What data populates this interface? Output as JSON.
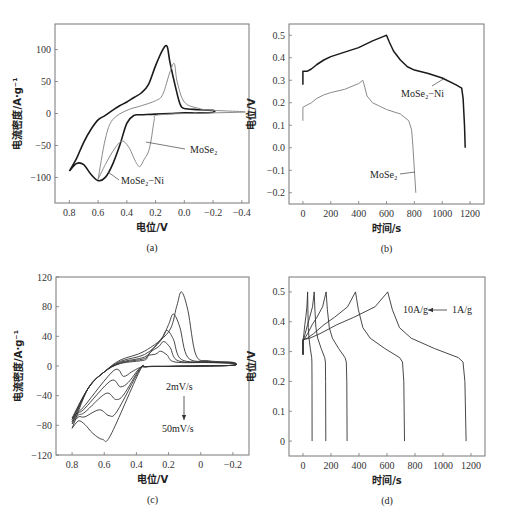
{
  "figure": {
    "panels": [
      "(a)",
      "(b)",
      "(c)",
      "(d)"
    ]
  },
  "chart_data": [
    {
      "id": "a",
      "type": "line",
      "panel_label": "(a)",
      "xlabel": "电位/V",
      "ylabel": "电流密度/A·g⁻¹",
      "xlim": [
        0.9,
        -0.45
      ],
      "ylim": [
        -140,
        140
      ],
      "xticks": [
        0.8,
        0.6,
        0.4,
        0.2,
        0.0,
        -0.2,
        -0.4
      ],
      "xtick_labels": [
        "0.8",
        "0.6",
        "0.4",
        "0.2",
        "0.0",
        "−0.2",
        "−0.4"
      ],
      "yticks": [
        100,
        50,
        0,
        -50,
        -100
      ],
      "ytick_labels": [
        "100",
        "50",
        "0",
        "−50",
        "−100"
      ],
      "frame": {
        "left": 55,
        "top": 24,
        "right": 249,
        "bottom": 203
      },
      "series": [
        {
          "name": "MoSe₂-Ni",
          "color": "#1a1a1a",
          "width": 1.6,
          "x": [
            0.8,
            0.75,
            0.7,
            0.65,
            0.6,
            0.55,
            0.5,
            0.45,
            0.4,
            0.35,
            0.3,
            0.2,
            0.1,
            0.0,
            -0.1,
            -0.2,
            -0.2,
            -0.1,
            0.0,
            0.03,
            0.06,
            0.1,
            0.12,
            0.15,
            0.2,
            0.25,
            0.3,
            0.35,
            0.4,
            0.45,
            0.5,
            0.55,
            0.6,
            0.65,
            0.7,
            0.75,
            0.8
          ],
          "y": [
            -90,
            -78,
            -80,
            -95,
            -105,
            -100,
            -80,
            -50,
            -15,
            -3,
            -2,
            -1,
            0,
            1,
            1,
            2,
            5,
            6,
            8,
            15,
            40,
            80,
            105,
            100,
            75,
            45,
            32,
            25,
            18,
            12,
            5,
            -3,
            -10,
            -25,
            -45,
            -70,
            -90
          ]
        },
        {
          "name": "MoSe₂",
          "color": "#8a8a8a",
          "width": 1.0,
          "x": [
            0.6,
            0.55,
            0.5,
            0.45,
            0.42,
            0.38,
            0.34,
            0.31,
            0.28,
            0.25,
            0.23,
            0.21,
            0.2,
            0.1,
            0.0,
            -0.2,
            -0.4,
            -0.4,
            -0.2,
            -0.1,
            0.0,
            0.05,
            0.07,
            0.1,
            0.15,
            0.2,
            0.3,
            0.4,
            0.5,
            0.55,
            0.6
          ],
          "y": [
            -103,
            -80,
            -60,
            -45,
            -44,
            -55,
            -75,
            -83,
            -72,
            -60,
            -40,
            -10,
            -3,
            -1,
            0,
            1,
            2,
            3,
            5,
            8,
            18,
            50,
            78,
            65,
            30,
            20,
            12,
            5,
            -10,
            -40,
            -103
          ]
        }
      ],
      "annotations": [
        {
          "text": "MoSe₂",
          "x": 190,
          "y": 153,
          "line": [
            [
              146,
              142
            ],
            [
              185,
              149
            ]
          ]
        },
        {
          "text": "MoSe₂−Ni",
          "x": 121,
          "y": 184,
          "line": [
            [
              108,
              172
            ],
            [
              119,
              180
            ]
          ]
        }
      ]
    },
    {
      "id": "b",
      "type": "line",
      "panel_label": "(b)",
      "xlabel": "时间/s",
      "ylabel": "电位/V",
      "xlim": [
        -100,
        1300
      ],
      "ylim": [
        -0.25,
        0.55
      ],
      "xticks": [
        0,
        200,
        400,
        600,
        800,
        1000,
        1200
      ],
      "xtick_labels": [
        "0",
        "200",
        "400",
        "600",
        "800",
        "1000",
        "1200"
      ],
      "yticks": [
        0.5,
        0.4,
        0.3,
        0.2,
        0.1,
        0.0,
        -0.1,
        -0.2
      ],
      "ytick_labels": [
        "0.5",
        "0.4",
        "0.3",
        "0.2",
        "0.1",
        "0.0",
        "−0.1",
        "−0.2"
      ],
      "frame": {
        "left": 289,
        "top": 24,
        "right": 484,
        "bottom": 204
      },
      "series": [
        {
          "name": "MoSe₂-Ni",
          "color": "#1a1a1a",
          "width": 1.5,
          "x": [
            0,
            0,
            30,
            60,
            100,
            150,
            200,
            300,
            400,
            500,
            580,
            600,
            620,
            650,
            700,
            750,
            800,
            900,
            1000,
            1100,
            1140,
            1150,
            1160,
            1165
          ],
          "y": [
            0.28,
            0.34,
            0.34,
            0.35,
            0.37,
            0.39,
            0.405,
            0.425,
            0.445,
            0.475,
            0.495,
            0.5,
            0.47,
            0.43,
            0.39,
            0.36,
            0.345,
            0.33,
            0.31,
            0.28,
            0.265,
            0.22,
            0.1,
            0.0
          ]
        },
        {
          "name": "MoSe₂",
          "color": "#8a8a8a",
          "width": 1.0,
          "x": [
            0,
            0,
            30,
            60,
            100,
            150,
            200,
            300,
            400,
            430,
            440,
            460,
            500,
            550,
            600,
            700,
            760,
            780,
            790,
            800,
            810
          ],
          "y": [
            0.12,
            0.18,
            0.19,
            0.2,
            0.22,
            0.235,
            0.245,
            0.26,
            0.285,
            0.3,
            0.28,
            0.23,
            0.2,
            0.185,
            0.17,
            0.15,
            0.12,
            0.08,
            0.0,
            -0.1,
            -0.2
          ]
        }
      ],
      "annotations": [
        {
          "text": "MoSe₂−Ni",
          "x": 401,
          "y": 97,
          "line": [
            [
              432,
              86
            ],
            [
              445,
              78
            ]
          ]
        },
        {
          "text": "MoSe₂",
          "x": 370,
          "y": 178,
          "line": [
            [
              400,
              174
            ],
            [
              415,
              172
            ]
          ]
        }
      ]
    },
    {
      "id": "c",
      "type": "line",
      "panel_label": "(c)",
      "xlabel": "电位/V",
      "ylabel": "电流密度/A·g⁻¹",
      "xlim": [
        0.9,
        -0.3
      ],
      "ylim": [
        -120,
        120
      ],
      "xticks": [
        0.8,
        0.6,
        0.4,
        0.2,
        0,
        -0.2
      ],
      "xtick_labels": [
        "0.8",
        "0.6",
        "0.4",
        "0.2",
        "0",
        "−0.2"
      ],
      "yticks": [
        120,
        80,
        40,
        0,
        -40,
        -80,
        -120
      ],
      "ytick_labels": [
        "120",
        "80",
        "40",
        "0",
        "−40",
        "−80",
        "−120"
      ],
      "frame": {
        "left": 56,
        "top": 277,
        "right": 249,
        "bottom": 455
      },
      "scan_rates": [
        "2mV/s",
        "5mV/s",
        "10mV/s",
        "20mV/s",
        "30mV/s",
        "50mV/s"
      ],
      "series": [
        {
          "name": "2mV/s",
          "anodic_peak": [
            0.25,
            20
          ],
          "cathodic_peak": [
            0.48,
            -14
          ],
          "vertex_current": -70
        },
        {
          "name": "5mV/s",
          "anodic_peak": [
            0.23,
            33
          ],
          "cathodic_peak": [
            0.5,
            -28
          ],
          "vertex_current": -72
        },
        {
          "name": "10mV/s",
          "anodic_peak": [
            0.21,
            48
          ],
          "cathodic_peak": [
            0.53,
            -45
          ],
          "vertex_current": -75
        },
        {
          "name": "20mV/s",
          "anodic_peak": [
            0.17,
            70
          ],
          "cathodic_peak": [
            0.57,
            -67
          ],
          "vertex_current": -78
        },
        {
          "name": "50mV/s",
          "anodic_peak": [
            0.12,
            100
          ],
          "cathodic_peak": [
            0.61,
            -99
          ],
          "vertex_current": -84
        }
      ],
      "annotations": [
        {
          "text": "2mV/s",
          "x": 166,
          "y": 390
        },
        {
          "text": "50mV/s",
          "x": 162,
          "y": 432,
          "arrow": [
            [
              184,
              396
            ],
            [
              184,
              420
            ]
          ]
        }
      ]
    },
    {
      "id": "d",
      "type": "line",
      "panel_label": "(d)",
      "xlabel": "时间/s",
      "ylabel": "电位/V",
      "xlim": [
        -100,
        1300
      ],
      "ylim": [
        -0.05,
        0.55
      ],
      "xticks": [
        0,
        200,
        400,
        600,
        800,
        1000,
        1200
      ],
      "xtick_labels": [
        "0",
        "200",
        "400",
        "600",
        "800",
        "1000",
        "1200"
      ],
      "yticks": [
        0.5,
        0.4,
        0.3,
        0.2,
        0.1,
        0
      ],
      "ytick_labels": [
        "0.5",
        "0.4",
        "0.3",
        "0.2",
        "0.1",
        "0"
      ],
      "frame": {
        "left": 289,
        "top": 277,
        "right": 485,
        "bottom": 456
      },
      "series": [
        {
          "name": "1A/g",
          "charge_end": 605,
          "discharge_end": 1165
        },
        {
          "name": "2A/g",
          "charge_end": 375,
          "discharge_end": 725
        },
        {
          "name": "4A/g",
          "charge_end": 165,
          "discharge_end": 315
        },
        {
          "name": "7A/g",
          "charge_end": 80,
          "discharge_end": 163
        },
        {
          "name": "10A/g",
          "charge_end": 33,
          "discharge_end": 65
        }
      ],
      "annotations": [
        {
          "text": "10A/g",
          "x": 403,
          "y": 313
        },
        {
          "text": "1A/g",
          "x": 452,
          "y": 313,
          "arrow": [
            [
              447,
              310
            ],
            [
              428,
              310
            ]
          ]
        }
      ]
    }
  ]
}
